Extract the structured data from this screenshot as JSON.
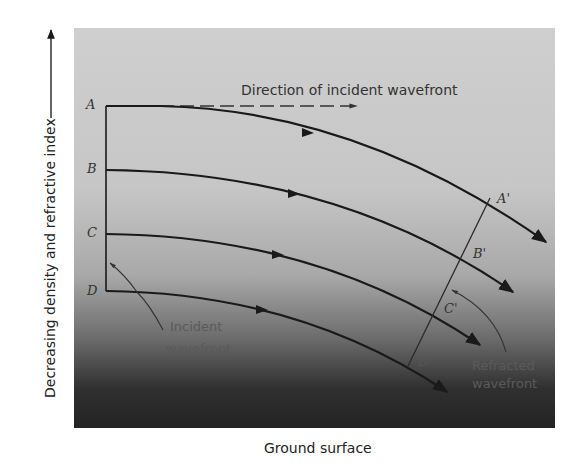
{
  "figure": {
    "y_axis_label": "Decreasing density and refractive index",
    "x_axis_label": "Ground surface",
    "direction_label": "Direction of incident wavefront",
    "incident_label_line1": "Incident",
    "incident_label_line2": "wavefront",
    "refracted_label_line1": "Refracted",
    "refracted_label_line2": "wavefront",
    "points": {
      "A": "A",
      "B": "B",
      "C": "C",
      "D": "D",
      "A_prime": "A'",
      "B_prime": "B'",
      "C_prime": "C'",
      "D_prime": "D'"
    },
    "colors": {
      "line": "#1a1a1a",
      "panel_top": "#cfcfcf",
      "panel_bottom": "#232323"
    }
  }
}
